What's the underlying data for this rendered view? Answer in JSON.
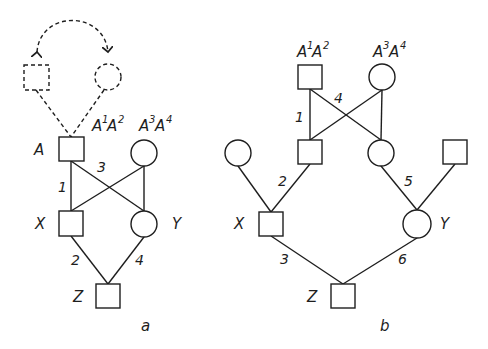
{
  "panel_a": {
    "caption": "a",
    "labels": {
      "A": "A",
      "X": "X",
      "Y": "Y",
      "Z": "Z"
    },
    "genotype_left": {
      "base1": "A",
      "sup1": "1",
      "base2": "A",
      "sup2": "2"
    },
    "genotype_right": {
      "base1": "A",
      "sup1": "3",
      "base2": "A",
      "sup2": "4"
    },
    "path_numbers": {
      "n1": "1",
      "n2": "2",
      "n3": "3",
      "n4": "4"
    }
  },
  "panel_b": {
    "caption": "b",
    "labels": {
      "X": "X",
      "Y": "Y",
      "Z": "Z"
    },
    "genotype_left": {
      "base1": "A",
      "sup1": "1",
      "base2": "A",
      "sup2": "2"
    },
    "genotype_right": {
      "base1": "A",
      "sup1": "3",
      "base2": "A",
      "sup2": "4"
    },
    "path_numbers": {
      "n1": "1",
      "n2": "2",
      "n3": "3",
      "n4": "4",
      "n5": "5",
      "n6": "6"
    }
  },
  "colors": {
    "ink": "#1e1e1e",
    "background": "#ffffff"
  }
}
